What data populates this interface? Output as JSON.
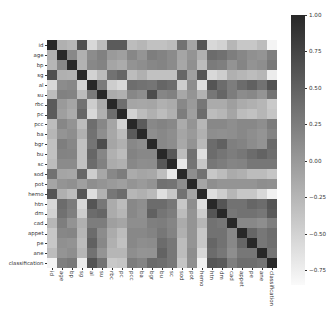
{
  "chart_data": {
    "type": "heatmap",
    "title": "",
    "xlabel": "",
    "ylabel": "",
    "colormap": "gray_r",
    "vmin": -0.85,
    "vmax": 1.0,
    "grid": false,
    "legend_position": "right colorbar",
    "labels": [
      "id",
      "age",
      "bp",
      "sg",
      "al",
      "su",
      "rbc",
      "pc",
      "pcc",
      "ba",
      "bgr",
      "bu",
      "sc",
      "sod",
      "pot",
      "hemo",
      "htn",
      "dm",
      "cad",
      "appet",
      "pe",
      "ane",
      "classification"
    ],
    "colorbar_ticks": [
      1.0,
      0.75,
      0.5,
      0.25,
      0.0,
      -0.25,
      -0.5,
      -0.75
    ],
    "colorbar_tick_labels": [
      "1.00",
      "0.75",
      "0.50",
      "0.25",
      "0.00",
      "−0.25",
      "−0.50",
      "−0.75"
    ],
    "matrix": [
      [
        1.0,
        -0.2,
        -0.25,
        0.65,
        -0.55,
        -0.3,
        0.55,
        0.55,
        -0.3,
        -0.25,
        -0.35,
        -0.35,
        -0.3,
        0.35,
        -0.1,
        0.6,
        -0.55,
        -0.5,
        -0.25,
        -0.4,
        -0.4,
        -0.3,
        -0.8
      ],
      [
        -0.2,
        1.0,
        0.15,
        -0.2,
        0.12,
        0.22,
        0.0,
        -0.05,
        0.16,
        0.05,
        0.24,
        0.2,
        0.13,
        -0.1,
        0.05,
        -0.2,
        0.4,
        0.36,
        0.24,
        0.16,
        0.08,
        0.05,
        0.23
      ],
      [
        -0.25,
        0.15,
        1.0,
        -0.22,
        0.15,
        0.2,
        -0.1,
        -0.15,
        0.06,
        0.1,
        0.16,
        0.19,
        0.13,
        -0.12,
        0.08,
        -0.3,
        0.27,
        0.23,
        0.06,
        0.18,
        0.06,
        0.1,
        0.29
      ],
      [
        0.65,
        -0.2,
        -0.22,
        1.0,
        -0.5,
        -0.3,
        0.35,
        0.45,
        -0.3,
        -0.2,
        -0.35,
        -0.35,
        -0.35,
        0.45,
        -0.05,
        0.6,
        -0.55,
        -0.45,
        -0.2,
        -0.25,
        -0.3,
        -0.25,
        -0.73
      ],
      [
        -0.55,
        0.12,
        0.15,
        -0.5,
        1.0,
        0.27,
        -0.45,
        -0.55,
        0.38,
        0.35,
        0.32,
        0.45,
        0.4,
        -0.45,
        0.1,
        -0.6,
        0.6,
        0.4,
        0.25,
        0.4,
        0.5,
        0.35,
        0.62
      ],
      [
        -0.3,
        0.22,
        0.2,
        -0.3,
        0.27,
        1.0,
        -0.15,
        -0.2,
        0.16,
        0.1,
        0.67,
        0.17,
        0.22,
        -0.12,
        0.05,
        -0.22,
        0.3,
        0.45,
        0.25,
        0.12,
        0.15,
        0.05,
        0.34
      ],
      [
        0.55,
        0.0,
        -0.1,
        0.35,
        -0.45,
        -0.15,
        1.0,
        0.38,
        -0.1,
        -0.12,
        -0.1,
        -0.2,
        -0.15,
        0.15,
        0.0,
        0.3,
        -0.15,
        -0.15,
        -0.05,
        -0.15,
        -0.2,
        -0.25,
        -0.42
      ],
      [
        0.55,
        -0.05,
        -0.15,
        0.45,
        -0.55,
        -0.2,
        0.38,
        1.0,
        -0.5,
        -0.3,
        -0.2,
        -0.3,
        -0.2,
        0.25,
        -0.05,
        0.4,
        -0.3,
        -0.25,
        -0.1,
        -0.3,
        -0.35,
        -0.25,
        -0.38
      ],
      [
        -0.3,
        0.16,
        0.06,
        -0.3,
        0.38,
        0.16,
        -0.1,
        -0.5,
        1.0,
        0.55,
        0.15,
        0.2,
        0.15,
        -0.15,
        0.05,
        -0.25,
        0.15,
        0.15,
        0.1,
        0.15,
        0.15,
        0.1,
        0.26
      ],
      [
        -0.25,
        0.05,
        0.1,
        -0.2,
        0.35,
        0.1,
        -0.12,
        -0.3,
        0.55,
        1.0,
        0.1,
        0.15,
        0.1,
        -0.1,
        0.0,
        -0.2,
        0.1,
        0.08,
        0.1,
        0.15,
        0.1,
        0.05,
        0.19
      ],
      [
        -0.35,
        0.24,
        0.16,
        -0.35,
        0.32,
        0.67,
        -0.1,
        -0.2,
        0.15,
        0.1,
        1.0,
        0.15,
        0.11,
        -0.13,
        0.06,
        -0.28,
        0.4,
        0.5,
        0.23,
        0.2,
        0.12,
        0.06,
        0.42
      ],
      [
        -0.35,
        0.2,
        0.19,
        -0.35,
        0.45,
        0.17,
        -0.2,
        -0.3,
        0.2,
        0.15,
        0.15,
        1.0,
        0.58,
        -0.31,
        0.36,
        -0.61,
        0.4,
        0.32,
        0.25,
        0.3,
        0.4,
        0.48,
        0.38
      ],
      [
        -0.3,
        0.13,
        0.13,
        -0.35,
        0.4,
        0.22,
        -0.15,
        -0.2,
        0.15,
        0.1,
        0.11,
        0.58,
        1.0,
        -0.69,
        0.33,
        -0.4,
        0.3,
        0.25,
        0.18,
        0.2,
        0.3,
        0.3,
        0.3
      ],
      [
        0.35,
        -0.1,
        -0.12,
        0.45,
        -0.45,
        -0.12,
        0.15,
        0.25,
        -0.15,
        -0.1,
        -0.13,
        -0.31,
        -0.69,
        1.0,
        0.1,
        0.35,
        -0.4,
        -0.3,
        -0.15,
        -0.2,
        -0.3,
        -0.3,
        -0.38
      ],
      [
        -0.1,
        0.05,
        0.08,
        -0.05,
        0.1,
        0.05,
        0.0,
        -0.05,
        0.05,
        0.0,
        0.06,
        0.36,
        0.33,
        0.1,
        1.0,
        -0.1,
        0.1,
        0.05,
        0.05,
        0.05,
        0.05,
        0.1,
        0.08
      ],
      [
        0.6,
        -0.2,
        -0.3,
        0.6,
        -0.6,
        -0.22,
        0.3,
        0.4,
        -0.25,
        -0.2,
        -0.28,
        -0.61,
        -0.4,
        0.35,
        -0.1,
        1.0,
        -0.6,
        -0.45,
        -0.25,
        -0.4,
        -0.4,
        -0.55,
        -0.77
      ],
      [
        -0.55,
        0.4,
        0.27,
        -0.55,
        0.6,
        0.3,
        -0.15,
        -0.3,
        0.15,
        0.1,
        0.4,
        0.4,
        0.3,
        -0.4,
        0.1,
        -0.6,
        1.0,
        0.6,
        0.35,
        0.35,
        0.45,
        0.4,
        0.6
      ],
      [
        -0.5,
        0.36,
        0.23,
        -0.45,
        0.4,
        0.45,
        -0.15,
        -0.25,
        0.15,
        0.08,
        0.5,
        0.32,
        0.25,
        -0.3,
        0.05,
        -0.45,
        0.6,
        1.0,
        0.3,
        0.35,
        0.35,
        0.3,
        0.56
      ],
      [
        -0.25,
        0.24,
        0.06,
        -0.2,
        0.25,
        0.25,
        -0.05,
        -0.1,
        0.1,
        0.1,
        0.23,
        0.25,
        0.18,
        -0.15,
        0.05,
        -0.25,
        0.35,
        0.3,
        1.0,
        0.15,
        0.15,
        0.1,
        0.24
      ],
      [
        -0.4,
        0.16,
        0.18,
        -0.25,
        0.4,
        0.12,
        -0.15,
        -0.3,
        0.15,
        0.15,
        0.2,
        0.3,
        0.2,
        -0.2,
        0.05,
        -0.4,
        0.35,
        0.35,
        0.15,
        1.0,
        0.45,
        0.3,
        0.39
      ],
      [
        -0.4,
        0.08,
        0.06,
        -0.3,
        0.5,
        0.15,
        -0.2,
        -0.35,
        0.15,
        0.1,
        0.12,
        0.4,
        0.3,
        -0.3,
        0.05,
        -0.4,
        0.45,
        0.35,
        0.15,
        0.45,
        1.0,
        0.3,
        0.38
      ],
      [
        -0.3,
        0.05,
        0.1,
        -0.25,
        0.35,
        0.05,
        -0.25,
        -0.25,
        0.1,
        0.05,
        0.06,
        0.48,
        0.3,
        -0.3,
        0.1,
        -0.55,
        0.4,
        0.3,
        0.1,
        0.3,
        0.3,
        1.0,
        0.33
      ],
      [
        -0.8,
        0.23,
        0.29,
        -0.73,
        0.62,
        0.34,
        -0.42,
        -0.38,
        0.26,
        0.19,
        0.42,
        0.38,
        0.3,
        -0.38,
        0.08,
        -0.77,
        0.6,
        0.56,
        0.24,
        0.39,
        0.38,
        0.33,
        1.0
      ]
    ]
  }
}
